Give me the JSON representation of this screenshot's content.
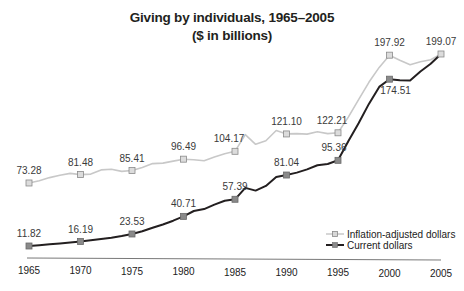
{
  "chart_data": {
    "type": "line",
    "title": "Giving by individuals, 1965–2005",
    "subtitle": "($ in billions)",
    "xlabel": "",
    "ylabel": "",
    "x_ticks": [
      1965,
      1970,
      1975,
      1980,
      1985,
      1990,
      1995,
      2000,
      2005
    ],
    "grid": false,
    "legend_position": "lower right",
    "series": [
      {
        "name": "Inflation-adjusted dollars",
        "color": "#c8c8c8",
        "marker_fill": "#a8a8a8",
        "labeled_points": [
          {
            "x": 1965,
            "y": 73.28,
            "label": "73.28"
          },
          {
            "x": 1970,
            "y": 81.48,
            "label": "81.48"
          },
          {
            "x": 1975,
            "y": 85.41,
            "label": "85.41"
          },
          {
            "x": 1980,
            "y": 96.49,
            "label": "96.49"
          },
          {
            "x": 1985,
            "y": 104.17,
            "label": "104.17"
          },
          {
            "x": 1990,
            "y": 121.1,
            "label": "121.10"
          },
          {
            "x": 1995,
            "y": 122.21,
            "label": "122.21"
          },
          {
            "x": 2000,
            "y": 197.92,
            "label": "197.92"
          },
          {
            "x": 2005,
            "y": 199.07,
            "label": "199.07"
          }
        ],
        "annual": [
          73.28,
          75.5,
          78.5,
          80.9,
          82.6,
          81.48,
          81.9,
          86.0,
          86.6,
          84.6,
          85.41,
          88.5,
          92.2,
          92.7,
          94.6,
          96.49,
          96.0,
          95.0,
          98.6,
          101.8,
          104.17,
          120.5,
          111.0,
          114.5,
          124.5,
          121.1,
          121.4,
          120.9,
          123.3,
          121.4,
          122.21,
          137.5,
          154.5,
          171.5,
          186.0,
          197.92,
          193.0,
          188.5,
          191.5,
          193.5,
          199.07
        ]
      },
      {
        "name": "Current dollars",
        "color": "#231f20",
        "marker_fill": "#8a8a8a",
        "labeled_points": [
          {
            "x": 1965,
            "y": 11.82,
            "label": "11.82"
          },
          {
            "x": 1970,
            "y": 16.19,
            "label": "16.19"
          },
          {
            "x": 1975,
            "y": 23.53,
            "label": "23.53"
          },
          {
            "x": 1980,
            "y": 40.71,
            "label": "40.71"
          },
          {
            "x": 1985,
            "y": 57.39,
            "label": "57.39"
          },
          {
            "x": 1990,
            "y": 81.04,
            "label": "81.04"
          },
          {
            "x": 1995,
            "y": 95.36,
            "label": "95.36"
          },
          {
            "x": 2000,
            "y": 174.51,
            "label": "174.51"
          },
          {
            "x": 2005,
            "y": 199.07,
            "label": "199.07"
          }
        ],
        "annual": [
          11.82,
          12.6,
          13.5,
          14.3,
          15.2,
          16.19,
          17.4,
          18.6,
          19.8,
          21.5,
          23.53,
          26.3,
          29.6,
          32.8,
          36.5,
          40.71,
          46.0,
          47.8,
          52.2,
          56.0,
          57.39,
          68.5,
          65.8,
          70.4,
          79.0,
          81.04,
          83.4,
          86.5,
          90.6,
          91.8,
          95.36,
          114.0,
          131.5,
          150.4,
          167.0,
          174.51,
          173.5,
          173.2,
          182.0,
          189.5,
          199.07
        ]
      }
    ],
    "ylim": [
      0,
      210
    ]
  }
}
